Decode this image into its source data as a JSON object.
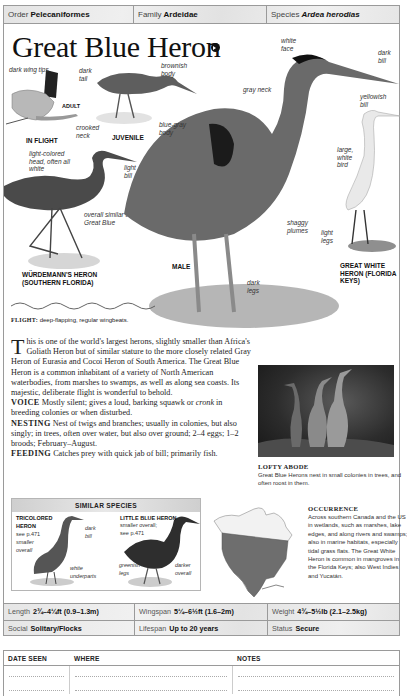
{
  "taxonomy": {
    "order_label": "Order",
    "order_value": "Pelecaniformes",
    "family_label": "Family",
    "family_value": "Ardeidae",
    "species_label": "Species",
    "species_value": "Ardea herodias"
  },
  "title": "Great Blue Heron",
  "sound_icon": "speaker-icon",
  "annotations": {
    "dark_wing_tips": "dark wing tips",
    "adult": "ADULT",
    "crooked_neck": "crooked neck",
    "in_flight": "IN FLIGHT",
    "dark_tail": "dark tail",
    "brownish_body": "brownish body",
    "juvenile": "JUVENILE",
    "light_colored_head": "light-colored head, often all white",
    "light_bill": "light bill",
    "overall_similar": "overall similar to Great Blue",
    "wurdemann_caption": "WÜRDEMANN'S HERON (SOUTHERN FLORIDA)",
    "white_face": "white face",
    "dark_bill": "dark bill",
    "gray_neck": "gray neck",
    "blue_gray_body": "blue-gray body",
    "shaggy_plumes": "shaggy plumes",
    "male": "MALE",
    "dark_legs": "dark legs",
    "yellowish_bill": "yellowish bill",
    "large_white_bird": "large, white bird",
    "light_legs": "light legs",
    "great_white_caption": "GREAT WHITE HERON (FLORIDA KEYS)"
  },
  "flight": {
    "label": "FLIGHT:",
    "text": "deep-flapping, regular wingbeats."
  },
  "description": {
    "dropcap": "T",
    "intro": "his is one of the world's largest herons, slightly smaller than Africa's Goliath Heron but of similar stature to the more closely related Gray Heron of Eurasia and Cocoi Heron of South America. The Great Blue Heron is a common inhabitant of a variety of North American waterbodies, from marshes to swamps, as well as along sea coasts. Its majestic, deliberate flight is wonderful to behold.",
    "voice_label": "VOICE",
    "voice_text_a": "Mostly silent; gives a loud, barking squawk or",
    "voice_italic": "cronk",
    "voice_text_b": "in breeding colonies or when disturbed.",
    "nesting_label": "NESTING",
    "nesting_text": "Nest of twigs and branches; usually in colonies, but also singly; in trees, often over water, but also over ground; 2–4 eggs; 1–2 broods; February–August.",
    "feeding_label": "FEEDING",
    "feeding_text": "Catches prey with quick jab of bill; primarily fish."
  },
  "photo": {
    "title": "LOFTY ABODE",
    "caption": "Great Blue Herons nest in small colonies in trees, and often roost in them."
  },
  "similar_species": {
    "header": "SIMILAR SPECIES",
    "species": [
      {
        "name": "TRICOLORED HERON",
        "ref": "see p.471",
        "note": "smaller overall",
        "marks": [
          "dark bill",
          "white underparts"
        ]
      },
      {
        "name": "LITTLE BLUE HERON",
        "ref": "smaller overall; see p.471",
        "marks": [
          "greenish legs",
          "darker overall"
        ]
      }
    ]
  },
  "occurrence": {
    "title": "OCCURRENCE",
    "text": "Across southern Canada and the US in wetlands, such as marshes, lake edges, and along rivers and swamps; also in marine habitats, especially tidal grass flats. The Great White Heron is common in mangroves in the Florida Keys; also West Indies and Yucatán."
  },
  "stats": {
    "row1": [
      {
        "label": "Length",
        "value": "2¾–4¼ft (0.9–1.3m)"
      },
      {
        "label": "Wingspan",
        "value": "5¼–6½ft (1.6–2m)"
      },
      {
        "label": "Weight",
        "value": "4¾–5½lb (2.1–2.5kg)"
      }
    ],
    "row2": [
      {
        "label": "Social",
        "value": "Solitary/Flocks"
      },
      {
        "label": "Lifespan",
        "value": "Up to 20 years"
      },
      {
        "label": "Status",
        "value": "Secure"
      }
    ]
  },
  "log": {
    "headers": [
      "DATE SEEN",
      "WHERE",
      "NOTES"
    ],
    "blank_rows": 2
  }
}
